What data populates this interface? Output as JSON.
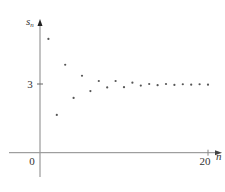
{
  "chart_data": {
    "type": "scatter",
    "title": "",
    "xlabel": "n",
    "ylabel": "s_n",
    "ylabel_main": "s",
    "ylabel_sub": "n",
    "x_ticks": [
      {
        "value": 0,
        "label": "0"
      },
      {
        "value": 20,
        "label": "20"
      }
    ],
    "y_ticks": [
      {
        "value": 3,
        "label": "3"
      }
    ],
    "xlim": [
      0,
      21
    ],
    "ylim": [
      0,
      5.8
    ],
    "grid": false,
    "legend": null,
    "x": [
      1,
      2,
      3,
      4,
      5,
      6,
      7,
      8,
      9,
      10,
      11,
      12,
      13,
      14,
      15,
      16,
      17,
      18,
      19,
      20
    ],
    "values": [
      4.97,
      1.65,
      3.84,
      2.39,
      3.36,
      2.69,
      3.13,
      2.85,
      3.13,
      2.86,
      3.06,
      2.93,
      3.0,
      2.95,
      3.0,
      2.96,
      2.99,
      2.97,
      2.99,
      2.97
    ],
    "point_color": "#555555",
    "axis_color": "#888888"
  }
}
